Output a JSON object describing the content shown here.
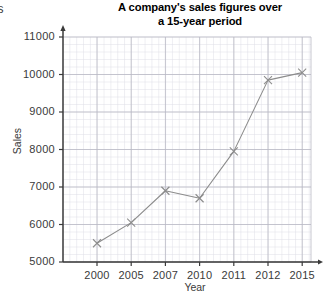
{
  "corner_fragment": "/s",
  "chart_data": {
    "type": "line",
    "title": "A company's sales figures over a 15-year period",
    "title_line1": "A company's sales figures over",
    "title_line2": "a 15-year period",
    "xlabel": "Year",
    "ylabel": "Sales",
    "categories": [
      "2000",
      "2005",
      "2007",
      "2010",
      "2011",
      "2012",
      "2015"
    ],
    "values": [
      5500,
      6050,
      6900,
      6700,
      7950,
      9850,
      10050
    ],
    "ytick_labels": [
      "5000",
      "6000",
      "7000",
      "8000",
      "9000",
      "10000",
      "11000"
    ],
    "ytick_values": [
      5000,
      6000,
      7000,
      8000,
      9000,
      10000,
      11000
    ],
    "ylim": [
      5000,
      11000
    ],
    "grid": true,
    "minor_grid": true,
    "legend": "none",
    "marker": "x",
    "line_color": "#8c8c8c",
    "marker_color": "#8c8c8c",
    "grid_major_color": "#b9b9c4",
    "grid_minor_color": "#dedee6",
    "axis_color": "#3a3a3a"
  }
}
